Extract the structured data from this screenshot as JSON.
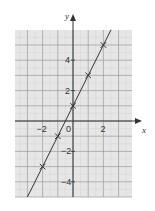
{
  "chart_data": {
    "type": "line",
    "title": "",
    "xlabel": "x",
    "ylabel": "y",
    "xlim": [
      -4,
      4
    ],
    "ylim": [
      -5,
      6
    ],
    "grid": true,
    "x_ticks": [
      "-2",
      "0",
      "2"
    ],
    "y_ticks": [
      "-4",
      "-2",
      "2",
      "4"
    ],
    "series": [
      {
        "name": "y = 2x + 1",
        "x": [
          -2,
          -1,
          0,
          1,
          2
        ],
        "y": [
          -3,
          -1,
          1,
          3,
          5
        ],
        "marker": "x"
      }
    ],
    "colors": {
      "grid_bg": "#e6e6e6",
      "grid_major": "#9a9a9a",
      "grid_minor": "#cfcfcf",
      "line": "#333333",
      "axis": "#333333"
    }
  }
}
